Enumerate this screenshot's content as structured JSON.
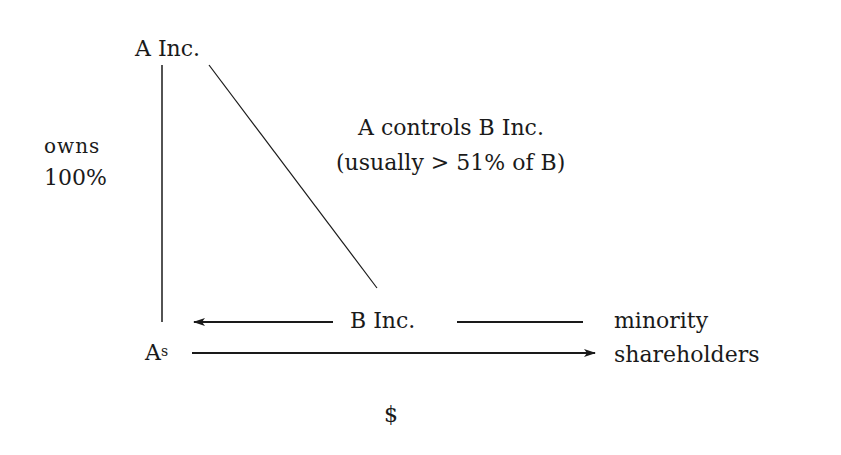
{
  "diagram": {
    "nodes": {
      "a_inc": "A Inc.",
      "b_inc": "B Inc.",
      "a_shareholders_base": "A",
      "a_shareholders_sup": "s",
      "minority_line1": "minority",
      "minority_line2": "shareholders"
    },
    "labels": {
      "owns_line1": "owns",
      "owns_line2": "100%",
      "controls_line1": "A controls B Inc.",
      "controls_line2": "(usually > 51% of B)",
      "dollar": "$"
    },
    "edges": [
      {
        "from": "A Inc.",
        "to": "A shareholders",
        "label": "owns 100%",
        "style": "line"
      },
      {
        "from": "A Inc.",
        "to": "B Inc.",
        "label": "A controls B Inc. (usually > 51% of B)",
        "style": "line"
      },
      {
        "from": "B Inc.",
        "to": "A shareholders",
        "label": "",
        "style": "arrow"
      },
      {
        "from": "B Inc.",
        "to": "minority shareholders",
        "label": "",
        "style": "line"
      },
      {
        "from": "A shareholders",
        "to": "minority shareholders",
        "label": "$",
        "style": "arrow"
      }
    ],
    "colors": {
      "ink": "#1a1a1a",
      "background": "#ffffff"
    }
  }
}
